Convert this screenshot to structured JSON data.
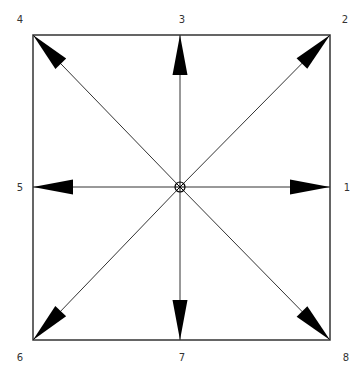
{
  "diagram": {
    "type": "direction-arrows",
    "frame": {
      "x1": 33,
      "y1": 35,
      "x2": 330,
      "y2": 340,
      "stroke": "#333333"
    },
    "center": {
      "x": 180,
      "y": 187
    },
    "arrow_color": "#000000",
    "directions": [
      {
        "id": 1,
        "label": "1",
        "tip": [
          330,
          187
        ],
        "label_pos": [
          347,
          188
        ]
      },
      {
        "id": 2,
        "label": "2",
        "tip": [
          330,
          35
        ],
        "label_pos": [
          345,
          20
        ]
      },
      {
        "id": 3,
        "label": "3",
        "tip": [
          180,
          35
        ],
        "label_pos": [
          182,
          20
        ]
      },
      {
        "id": 4,
        "label": "4",
        "tip": [
          33,
          35
        ],
        "label_pos": [
          20,
          20
        ]
      },
      {
        "id": 5,
        "label": "5",
        "tip": [
          33,
          187
        ],
        "label_pos": [
          20,
          188
        ]
      },
      {
        "id": 6,
        "label": "6",
        "tip": [
          33,
          340
        ],
        "label_pos": [
          20,
          358
        ]
      },
      {
        "id": 7,
        "label": "7",
        "tip": [
          180,
          340
        ],
        "label_pos": [
          182,
          358
        ]
      },
      {
        "id": 8,
        "label": "8",
        "tip": [
          330,
          340
        ],
        "label_pos": [
          346,
          358
        ]
      }
    ]
  }
}
